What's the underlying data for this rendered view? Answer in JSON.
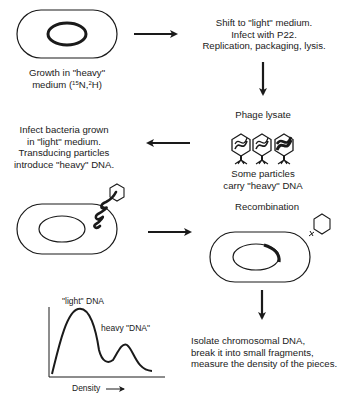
{
  "diagram": {
    "step1": {
      "label_line1": "Growth in \"heavy\"",
      "label_line2_prefix": "medium (",
      "isotope1_mass": "15",
      "isotope1_symbol": "N,",
      "isotope2_mass": "2",
      "isotope2_symbol": "H)"
    },
    "step2": {
      "line1": "Shift to \"light\" medium.",
      "line2": "Infect with P22.",
      "line3": "Replication, packaging, lysis."
    },
    "step3": {
      "title": "Phage lysate",
      "caption_line1": "Some particles",
      "caption_line2": "carry \"heavy\" DNA"
    },
    "step4": {
      "line1": "Infect bacteria grown",
      "line2": "in \"light\" medium.",
      "line3": "Transducing particles",
      "line4": "introduce \"heavy\" DNA."
    },
    "step5": {
      "title": "Recombination"
    },
    "step6": {
      "line1": "Isolate chromosomal DNA,",
      "line2": "break it into small fragments,",
      "line3": "measure the density of the pieces."
    },
    "plot": {
      "peak1_label": "\"light\" DNA",
      "peak2_label": "heavy \"DNA\"",
      "xlabel": "Density"
    },
    "colors": {
      "ink": "#1a1a1a",
      "background": "#ffffff"
    }
  }
}
